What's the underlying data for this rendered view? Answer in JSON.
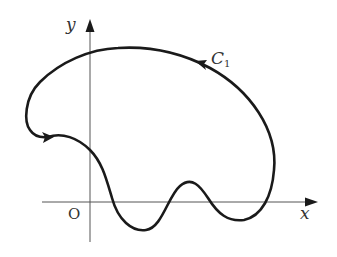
{
  "figure": {
    "axes": {
      "x_label": "x",
      "y_label": "y",
      "origin_label": "O"
    },
    "curve": {
      "label_main": "C",
      "label_sub": "1",
      "orientation": "counterclockwise",
      "arrow_count": 2
    },
    "colors": {
      "curve": "#1a1a1a",
      "axes": "#555555",
      "labels": "#333333",
      "background": "#ffffff"
    }
  }
}
